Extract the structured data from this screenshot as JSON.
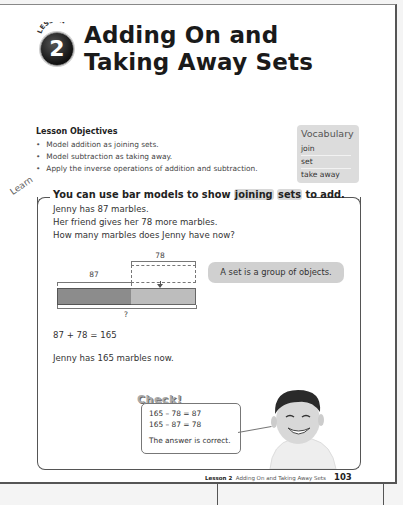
{
  "lesson": {
    "badge_word": "LESSON",
    "number": "2",
    "title_line1": "Adding On and",
    "title_line2": "Taking Away Sets"
  },
  "objectives": {
    "heading": "Lesson Objectives",
    "items": [
      "Model addition as joining sets.",
      "Model subtraction as taking away.",
      "Apply the inverse operations of addition and subtraction."
    ]
  },
  "vocabulary": {
    "title": "Vocabulary",
    "items": [
      "join",
      "set",
      "take away"
    ]
  },
  "learn": {
    "label": "Learn",
    "heading_pre": "You can use bar models to show ",
    "heading_hl1": "joining",
    "heading_hl2": "sets",
    "heading_post": " to add.",
    "problem": [
      "Jenny has 87 marbles.",
      "Her friend gives her 78 more marbles.",
      "How many marbles does Jenny have now?"
    ],
    "bar_model": {
      "part1": "87",
      "part2": "78",
      "whole": "?"
    },
    "note": "A set is a group of objects.",
    "equation": "87 + 78 = 165",
    "answer": "Jenny has 165 marbles now."
  },
  "check": {
    "title": "Check!",
    "lines": [
      "165 – 78 = 87",
      "165 – 87 = 78"
    ],
    "conclusion": "The answer is correct."
  },
  "footer": {
    "lesson": "Lesson 2",
    "title": "Adding On and Taking Away Sets",
    "page": "103"
  }
}
